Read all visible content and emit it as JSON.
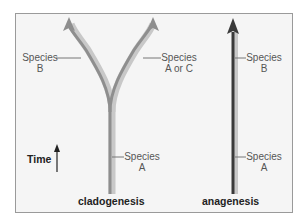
{
  "diagram": {
    "cladogenesis": {
      "title": "cladogenesis",
      "labels": {
        "left_branch": [
          "Species",
          "B"
        ],
        "right_branch": [
          "Species",
          "A or C"
        ],
        "trunk": [
          "Species",
          "A"
        ]
      }
    },
    "anagenesis": {
      "title": "anagenesis",
      "labels": {
        "upper": [
          "Species",
          "B"
        ],
        "lower": [
          "Species",
          "A"
        ]
      }
    },
    "time_axis": {
      "label": "Time"
    },
    "colors": {
      "frame_bg": "#f5f5f5",
      "frame_border": "#9a9a9a",
      "branch_light": "#bdbdbd",
      "branch_mid": "#8a8a8a",
      "anagenesis_line": "#3a3a3a",
      "label_text": "#555555",
      "title_text": "#222222"
    }
  }
}
